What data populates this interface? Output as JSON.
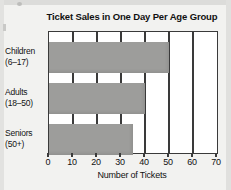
{
  "chart_data": {
    "type": "bar",
    "orientation": "horizontal",
    "title": "Ticket Sales in One Day Per Age Group",
    "xlabel": "Number of Tickets",
    "ylabel": "",
    "categories": [
      "Children (6–17)",
      "Adults (18–50)",
      "Seniors (50+)"
    ],
    "category_lines": [
      [
        "Children",
        "(6–17)"
      ],
      [
        "Adults",
        "(18–50)"
      ],
      [
        "Seniors",
        "(50+)"
      ]
    ],
    "values": [
      50,
      40,
      35
    ],
    "xlim": [
      0,
      70
    ],
    "xticks": [
      0,
      10,
      20,
      30,
      40,
      50,
      60,
      70
    ],
    "xtick_labels": [
      "0",
      "10",
      "20",
      "30",
      "40",
      "50",
      "60",
      "70"
    ],
    "grid": true,
    "grid_axis": "x",
    "legend": false,
    "bar_color": "#9d9d9b",
    "axis_color": "#3a3a3a",
    "plot_background": "#ffffff",
    "page_background": "#f2f2f0"
  }
}
